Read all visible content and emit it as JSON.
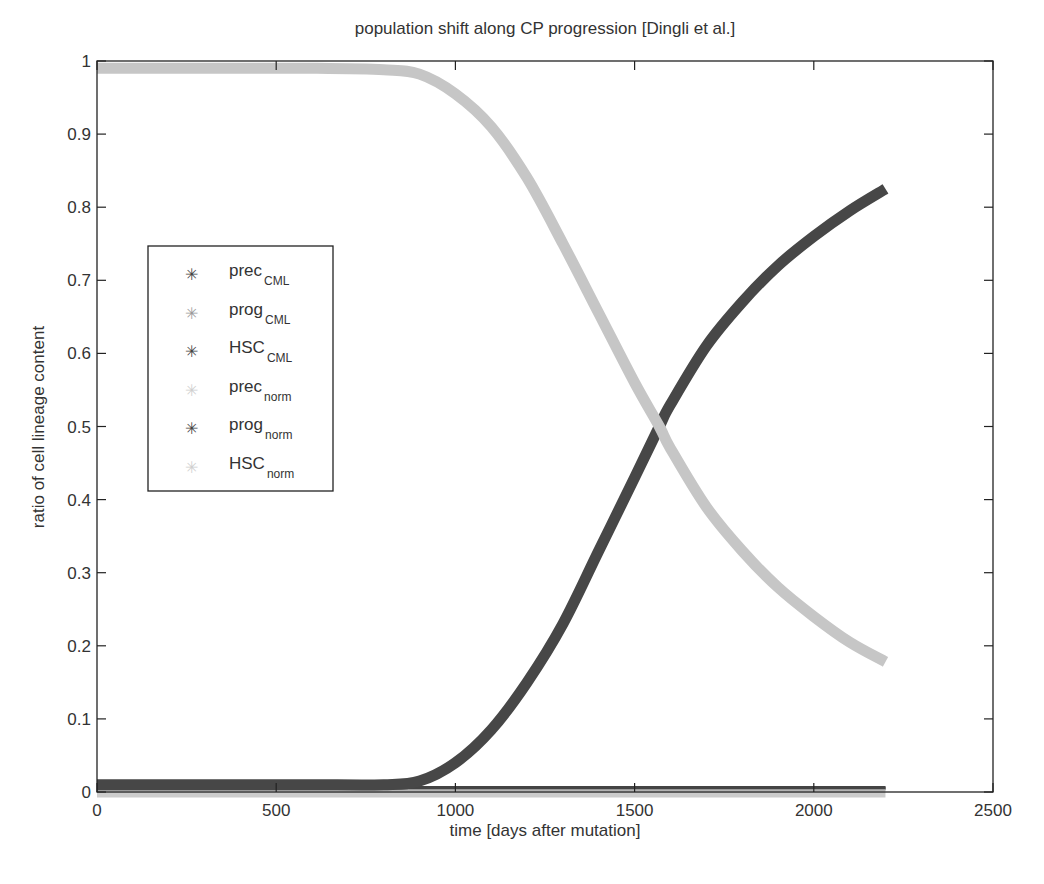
{
  "chart_data": {
    "type": "line",
    "title": "population shift along CP progression [Dingli et al.]",
    "xlabel": "time [days after mutation]",
    "ylabel": "ratio of cell lineage content",
    "xlim": [
      0,
      2500
    ],
    "ylim": [
      0,
      1
    ],
    "xticks": [
      0,
      500,
      1000,
      1500,
      2000,
      2500
    ],
    "yticks": [
      0,
      0.1,
      0.2,
      0.3,
      0.4,
      0.5,
      0.6,
      0.7,
      0.8,
      0.9,
      1
    ],
    "grid": false,
    "legend_position": "upper-left (inside)",
    "x": [
      0,
      200,
      400,
      600,
      800,
      900,
      1000,
      1100,
      1200,
      1300,
      1400,
      1500,
      1569,
      1600,
      1700,
      1800,
      1900,
      2000,
      2100,
      2200
    ],
    "series": [
      {
        "name": "prec_CML",
        "label": "prec",
        "sub": "CML",
        "color": "#444444",
        "width": 3,
        "values": [
          0.005,
          0.005,
          0.005,
          0.005,
          0.005,
          0.005,
          0.005,
          0.005,
          0.005,
          0.005,
          0.005,
          0.005,
          0.005,
          0.005,
          0.005,
          0.005,
          0.005,
          0.005,
          0.005,
          0.005
        ]
      },
      {
        "name": "prog_CML",
        "label": "prog",
        "sub": "CML",
        "color": "#9a9a9a",
        "width": 3,
        "values": [
          0.004,
          0.004,
          0.004,
          0.004,
          0.004,
          0.004,
          0.004,
          0.004,
          0.004,
          0.004,
          0.004,
          0.004,
          0.004,
          0.004,
          0.004,
          0.004,
          0.004,
          0.004,
          0.004,
          0.004
        ]
      },
      {
        "name": "HSC_CML",
        "label": "HSC",
        "sub": "CML",
        "color": "#474747",
        "width": 11,
        "values": [
          0.01,
          0.01,
          0.01,
          0.01,
          0.01,
          0.015,
          0.04,
          0.085,
          0.15,
          0.23,
          0.33,
          0.43,
          0.5,
          0.53,
          0.61,
          0.67,
          0.72,
          0.76,
          0.795,
          0.825
        ]
      },
      {
        "name": "prec_norm",
        "label": "prec",
        "sub": "norm",
        "color": "#cccccc",
        "width": 11,
        "values": [
          0,
          0,
          0,
          0,
          0,
          0,
          0,
          0,
          0,
          0,
          0,
          0,
          0,
          0,
          0,
          0,
          0,
          0,
          0,
          0
        ]
      },
      {
        "name": "prog_norm",
        "label": "prog",
        "sub": "norm",
        "color": "#444444",
        "width": 3,
        "values": [
          0.006,
          0.006,
          0.006,
          0.006,
          0.006,
          0.006,
          0.006,
          0.006,
          0.006,
          0.006,
          0.006,
          0.006,
          0.006,
          0.006,
          0.006,
          0.006,
          0.006,
          0.006,
          0.006,
          0.006
        ]
      },
      {
        "name": "HSC_norm",
        "label": "HSC",
        "sub": "norm",
        "color": "#c6c6c6",
        "width": 11,
        "values": [
          0.99,
          0.99,
          0.99,
          0.99,
          0.988,
          0.982,
          0.955,
          0.91,
          0.84,
          0.75,
          0.655,
          0.56,
          0.5,
          0.47,
          0.39,
          0.33,
          0.28,
          0.24,
          0.205,
          0.178
        ]
      }
    ]
  },
  "legend": {
    "items": [
      {
        "label": "prec",
        "sub": "CML",
        "color": "#444444"
      },
      {
        "label": "prog",
        "sub": "CML",
        "color": "#9a9a9a"
      },
      {
        "label": "HSC",
        "sub": "CML",
        "color": "#444444"
      },
      {
        "label": "prec",
        "sub": "norm",
        "color": "#cfcfcf"
      },
      {
        "label": "prog",
        "sub": "norm",
        "color": "#444444"
      },
      {
        "label": "HSC",
        "sub": "norm",
        "color": "#cfcfcf"
      }
    ]
  }
}
